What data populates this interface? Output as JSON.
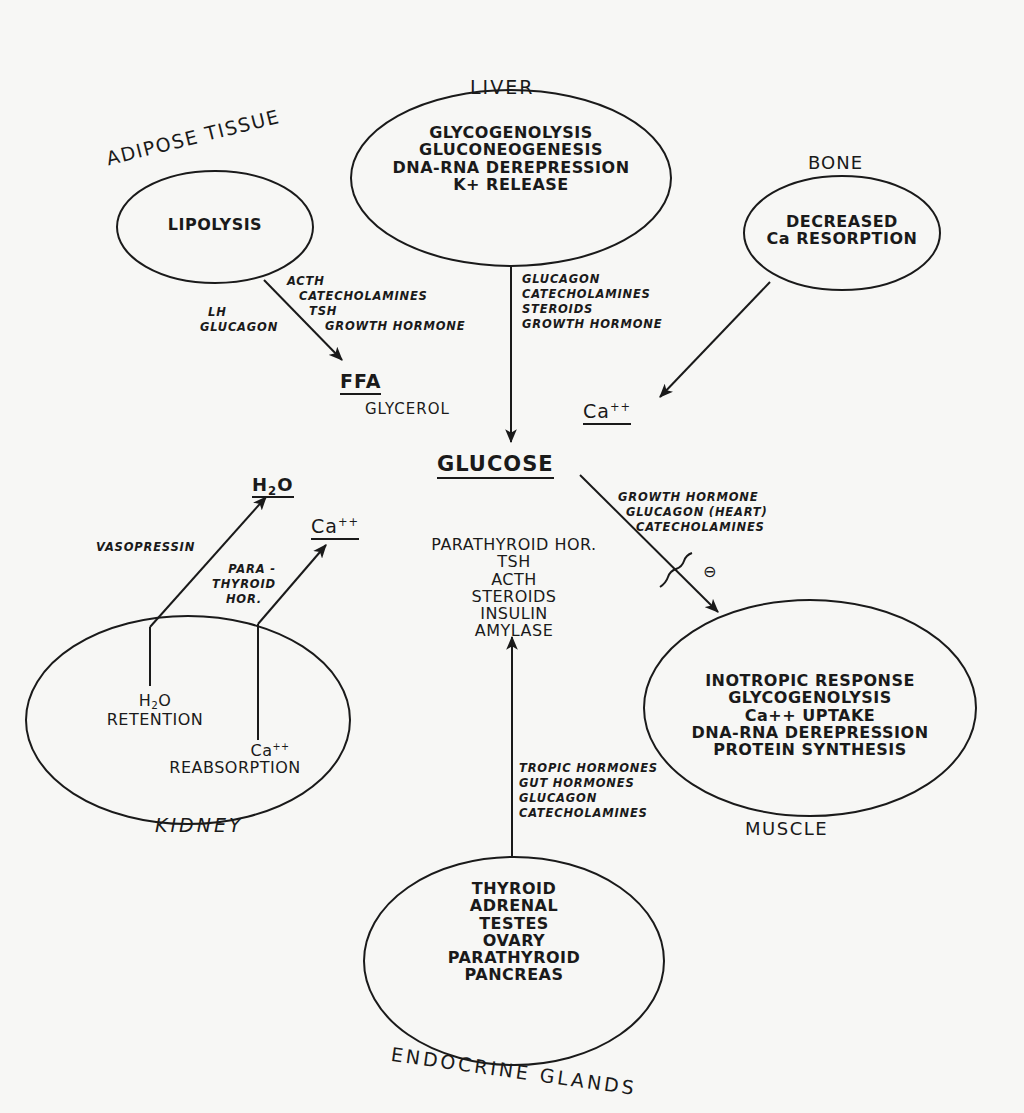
{
  "organs": {
    "liver": {
      "name": "LIVER",
      "processes": [
        "GLYCOGENOLYSIS",
        "GLUCONEOGENESIS",
        "DNA-RNA DEREPRESSION",
        "K+ RELEASE"
      ]
    },
    "adipose": {
      "name": "ADIPOSE TISSUE",
      "processes": [
        "LIPOLYSIS"
      ]
    },
    "bone": {
      "name": "BONE",
      "processes": [
        "DECREASED",
        "Ca RESORPTION"
      ]
    },
    "kidney": {
      "name": "KIDNEY",
      "processes": [
        "H2O RETENTION",
        "Ca++ REABSORPTION"
      ],
      "h2o": "H",
      "h2o_sub": "2",
      "h2o_tail": "O",
      "retention": "RETENTION",
      "ca": "Ca",
      "ca_sup": "++",
      "reabsorption": "REABSORPTION"
    },
    "muscle": {
      "name": "MUSCLE",
      "processes": [
        "INOTROPIC RESPONSE",
        "GLYCOGENOLYSIS",
        "Ca++ UPTAKE",
        "DNA-RNA DEREPRESSION",
        "PROTEIN SYNTHESIS"
      ]
    },
    "endocrine": {
      "name": "ENDOCRINE GLANDS",
      "processes": [
        "THYROID",
        "ADRENAL",
        "TESTES",
        "OVARY",
        "PARATHYROID",
        "PANCREAS"
      ]
    }
  },
  "products": {
    "glucose": "GLUCOSE",
    "ffa": "FFA",
    "glycerol": "GLYCEROL",
    "ca_bone": {
      "base": "Ca",
      "sup": "++"
    },
    "h2o": {
      "h": "H",
      "sub": "2",
      "o": "O"
    },
    "ca_kidney": {
      "base": "Ca",
      "sup": "++"
    }
  },
  "center_hormones": [
    "PARATHYROID HOR.",
    "TSH",
    "ACTH",
    "STEROIDS",
    "INSULIN",
    "AMYLASE"
  ],
  "regulators": {
    "adipose_right": [
      "ACTH",
      "CATECHOLAMINES",
      "TSH",
      "GROWTH HORMONE"
    ],
    "adipose_left": [
      "LH",
      "GLUCAGON"
    ],
    "liver": [
      "GLUCAGON",
      "CATECHOLAMINES",
      "STEROIDS",
      "GROWTH HORMONE"
    ],
    "muscle": [
      "GROWTH HORMONE",
      "GLUCAGON (HEART)",
      "CATECHOLAMINES"
    ],
    "muscle_inhibition_symbol": "⊖",
    "kidney_h2o": [
      "VASOPRESSIN"
    ],
    "kidney_ca": [
      "PARA -",
      "THYROID",
      "HOR."
    ],
    "endocrine": [
      "TROPIC HORMONES",
      "GUT HORMONES",
      "GLUCAGON",
      "CATECHOLAMINES"
    ]
  }
}
